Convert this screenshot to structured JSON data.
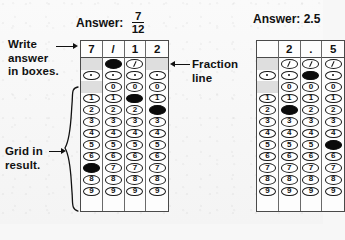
{
  "figure": {
    "background_color": "#f7f7f7",
    "ink_color": "#111111",
    "fill_color": "#0b0b0b"
  },
  "annotations": {
    "write_answer": "Write\nanswer\nin boxes.",
    "write_answer_line1": "Write",
    "write_answer_line2": "answer",
    "write_answer_line3": "in boxes.",
    "fraction_line_line1": "Fraction",
    "fraction_line_line2": "line",
    "grid_in_line1": "Grid in",
    "grid_in_line2": "result."
  },
  "grids": [
    {
      "id": "fraction-grid",
      "answer_label": "Answer:",
      "answer_type": "fraction",
      "answer_numerator": "7",
      "answer_denominator": "12",
      "header": [
        "7",
        "/",
        "1",
        "2"
      ],
      "bubble_rows": [
        {
          "symbol": "/",
          "type": "slash",
          "cells": [
            "none",
            "filled",
            "slash",
            "none"
          ]
        },
        {
          "symbol": ".",
          "type": "dot",
          "cells": [
            "dot",
            "dot",
            "dot",
            "dot"
          ]
        },
        {
          "symbol": "0",
          "type": "digit",
          "cells": [
            "none",
            "open",
            "open",
            "open"
          ]
        },
        {
          "symbol": "1",
          "type": "digit",
          "cells": [
            "open",
            "open",
            "filled",
            "open"
          ]
        },
        {
          "symbol": "2",
          "type": "digit",
          "cells": [
            "open",
            "open",
            "open",
            "filled"
          ]
        },
        {
          "symbol": "3",
          "type": "digit",
          "cells": [
            "open",
            "open",
            "open",
            "open"
          ]
        },
        {
          "symbol": "4",
          "type": "digit",
          "cells": [
            "open",
            "open",
            "open",
            "open"
          ]
        },
        {
          "symbol": "5",
          "type": "digit",
          "cells": [
            "open",
            "open",
            "open",
            "open"
          ]
        },
        {
          "symbol": "6",
          "type": "digit",
          "cells": [
            "open",
            "open",
            "open",
            "open"
          ]
        },
        {
          "symbol": "7",
          "type": "digit",
          "cells": [
            "filled",
            "open",
            "open",
            "open"
          ]
        },
        {
          "symbol": "8",
          "type": "digit",
          "cells": [
            "open",
            "open",
            "open",
            "open"
          ]
        },
        {
          "symbol": "9",
          "type": "digit",
          "cells": [
            "open",
            "open",
            "open",
            "open"
          ]
        }
      ]
    },
    {
      "id": "decimal-grid",
      "answer_label": "Answer: 2.5",
      "answer_type": "decimal",
      "answer_value": "2.5",
      "header": [
        "",
        "2",
        ".",
        "5"
      ],
      "bubble_rows": [
        {
          "symbol": "/",
          "type": "slash",
          "cells": [
            "none",
            "slash",
            "slash",
            "slash"
          ]
        },
        {
          "symbol": ".",
          "type": "dot",
          "cells": [
            "dot",
            "dot",
            "filled",
            "dot"
          ]
        },
        {
          "symbol": "0",
          "type": "digit",
          "cells": [
            "none",
            "open",
            "open",
            "open"
          ]
        },
        {
          "symbol": "1",
          "type": "digit",
          "cells": [
            "open",
            "open",
            "open",
            "open"
          ]
        },
        {
          "symbol": "2",
          "type": "digit",
          "cells": [
            "open",
            "filled",
            "open",
            "open"
          ]
        },
        {
          "symbol": "3",
          "type": "digit",
          "cells": [
            "open",
            "open",
            "open",
            "open"
          ]
        },
        {
          "symbol": "4",
          "type": "digit",
          "cells": [
            "open",
            "open",
            "open",
            "open"
          ]
        },
        {
          "symbol": "5",
          "type": "digit",
          "cells": [
            "open",
            "open",
            "open",
            "filled"
          ]
        },
        {
          "symbol": "6",
          "type": "digit",
          "cells": [
            "open",
            "open",
            "open",
            "open"
          ]
        },
        {
          "symbol": "7",
          "type": "digit",
          "cells": [
            "open",
            "open",
            "open",
            "open"
          ]
        },
        {
          "symbol": "8",
          "type": "digit",
          "cells": [
            "open",
            "open",
            "open",
            "open"
          ]
        },
        {
          "symbol": "9",
          "type": "digit",
          "cells": [
            "open",
            "open",
            "open",
            "open"
          ]
        }
      ]
    }
  ]
}
